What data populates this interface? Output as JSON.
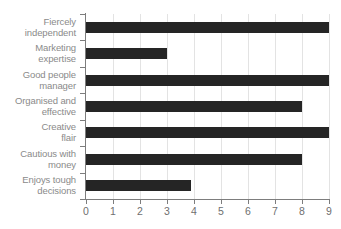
{
  "chart_data": {
    "type": "bar",
    "orientation": "horizontal",
    "title": "",
    "xlabel": "",
    "ylabel": "",
    "categories": [
      "Fiercely independent",
      "Marketing expertise",
      "Good people manager",
      "Organised and effective",
      "Creative flair",
      "Cautious with money",
      "Enjoys tough decisions"
    ],
    "category_lines": [
      [
        "Fiercely",
        "independent"
      ],
      [
        "Marketing",
        "expertise"
      ],
      [
        "Good people",
        "manager"
      ],
      [
        "Organised and",
        "effective"
      ],
      [
        "Creative",
        "flair"
      ],
      [
        "Cautious with",
        "money"
      ],
      [
        "Enjoys tough",
        "decisions"
      ]
    ],
    "values": [
      9,
      3,
      9,
      8,
      9,
      8,
      3.9
    ],
    "xlim": [
      0,
      9
    ],
    "xticks": [
      0,
      1,
      2,
      3,
      4,
      5,
      6,
      7,
      8,
      9
    ],
    "xtick_labels": [
      "0",
      "1",
      "2",
      "3",
      "4",
      "5",
      "6",
      "7",
      "8",
      "9"
    ],
    "grid": "vertical",
    "legend": "none",
    "colors": {
      "bar": "#252525",
      "gridline": "#e3e3e3",
      "axis": "#7d7d7d",
      "label_text": "#8a8a8a",
      "tick_text": "#6f6f6f",
      "background": "#ffffff"
    }
  }
}
